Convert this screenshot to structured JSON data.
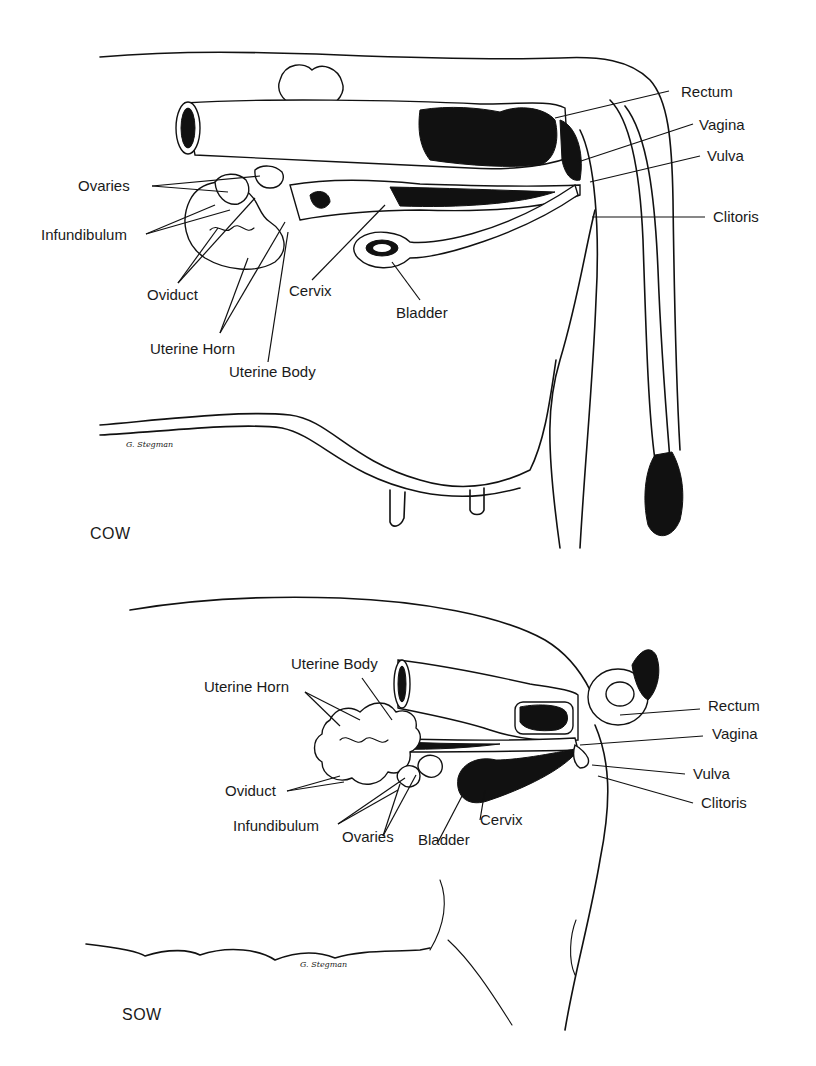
{
  "figure": {
    "panels": [
      {
        "id": "cow",
        "title": "COW",
        "signature": "G. Stegman",
        "labels": {
          "ovaries": "Ovaries",
          "infundibulum": "Infundibulum",
          "oviduct": "Oviduct",
          "uterine_horn": "Uterine Horn",
          "uterine_body": "Uterine Body",
          "cervix": "Cervix",
          "bladder": "Bladder",
          "rectum": "Rectum",
          "vagina": "Vagina",
          "vulva": "Vulva",
          "clitoris": "Clitoris"
        }
      },
      {
        "id": "sow",
        "title": "SOW",
        "signature": "G. Stegman",
        "labels": {
          "uterine_body": "Uterine Body",
          "uterine_horn": "Uterine Horn",
          "oviduct": "Oviduct",
          "infundibulum": "Infundibulum",
          "ovaries": "Ovaries",
          "bladder": "Bladder",
          "cervix": "Cervix",
          "rectum": "Rectum",
          "vagina": "Vagina",
          "vulva": "Vulva",
          "clitoris": "Clitoris"
        }
      }
    ]
  }
}
